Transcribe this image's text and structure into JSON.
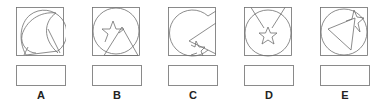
{
  "question": {
    "type": "figure-matching",
    "stroke_color": "#6e6e6e",
    "options": [
      {
        "label": "A",
        "shapes": [
          "square",
          "circle",
          "crescent",
          "triangle"
        ],
        "answer": ""
      },
      {
        "label": "B",
        "shapes": [
          "square",
          "circle",
          "star",
          "triangle"
        ],
        "answer": ""
      },
      {
        "label": "C",
        "shapes": [
          "square",
          "circle-with-wedge-cut",
          "star",
          "triangle"
        ],
        "answer": ""
      },
      {
        "label": "D",
        "shapes": [
          "square",
          "circle",
          "star",
          "v-shape"
        ],
        "answer": ""
      },
      {
        "label": "E",
        "shapes": [
          "square",
          "circle",
          "triangle",
          "star"
        ],
        "answer": ""
      }
    ]
  }
}
